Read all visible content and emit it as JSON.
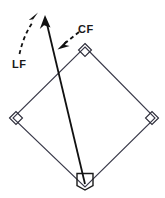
{
  "figure": {
    "type": "geometry-diagram",
    "background_color": "#ffffff",
    "stroke_color": "#3a3a4a",
    "ray_color": "#111111",
    "label_color": "#1a1a1a",
    "labels": [
      {
        "id": "lf",
        "text": "LF",
        "x": 12,
        "y": 68
      },
      {
        "id": "cf",
        "text": "CF",
        "x": 78,
        "y": 33
      }
    ],
    "shape": {
      "name": "square",
      "vertices": [
        {
          "id": "top",
          "x": 85,
          "y": 47
        },
        {
          "id": "right",
          "x": 155,
          "y": 118
        },
        {
          "id": "bottom",
          "x": 85,
          "y": 187
        },
        {
          "id": "left",
          "x": 13,
          "y": 118
        }
      ],
      "right_angle_markers": [
        "top",
        "right",
        "bottom",
        "left"
      ]
    },
    "rays": [
      {
        "id": "solid-ray",
        "style": "solid",
        "arrowhead": "end",
        "from": {
          "x": 85,
          "y": 185
        },
        "to": {
          "x": 45,
          "y": 16
        }
      },
      {
        "id": "lf-callout",
        "style": "dashed",
        "arrowhead": "end",
        "curve": true,
        "from": {
          "x": 20,
          "y": 54
        },
        "to": {
          "x": 37,
          "y": 13
        }
      },
      {
        "id": "cf-callout",
        "style": "dashed",
        "arrowhead": "end",
        "from": {
          "x": 80,
          "y": 31
        },
        "to": {
          "x": 59,
          "y": 48
        }
      }
    ]
  }
}
